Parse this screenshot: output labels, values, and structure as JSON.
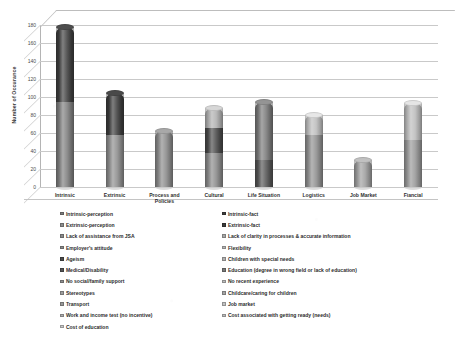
{
  "chart_data": {
    "type": "bar",
    "subtype": "stacked-column-3d",
    "title": "",
    "xlabel": "",
    "ylabel": "Number of Occurance",
    "ylim": [
      0,
      180
    ],
    "ytick_step": 20,
    "yticks": [
      "0",
      "20",
      "40",
      "60",
      "80",
      "100",
      "120",
      "140",
      "160",
      "180"
    ],
    "grid": true,
    "legend_position": "bottom",
    "categories": [
      "Intrinsic",
      "Extrinsic",
      "Process and Policies",
      "Cultural",
      "Life Situation",
      "Logistics",
      "Job Market",
      "Fiancial"
    ],
    "series": [
      {
        "name": "Intrinsic-perception",
        "color": "#7e7e7e",
        "values": [
          94,
          0,
          0,
          0,
          0,
          0,
          0,
          0
        ]
      },
      {
        "name": "Intrinsic-fact",
        "color": "#404040",
        "values": [
          84,
          0,
          0,
          0,
          0,
          0,
          0,
          0
        ]
      },
      {
        "name": "Extrinsic-perception",
        "color": "#8d8d8d",
        "values": [
          0,
          58,
          0,
          0,
          0,
          0,
          0,
          0
        ]
      },
      {
        "name": "Extrinsic-fact",
        "color": "#3c3c3c",
        "values": [
          0,
          47,
          0,
          0,
          0,
          0,
          0,
          0
        ]
      },
      {
        "name": "Lack of assistance from JSA",
        "color": "#8a8a8a",
        "values": [
          0,
          0,
          62,
          0,
          0,
          0,
          0,
          0
        ]
      },
      {
        "name": "Lack of clarity in processes & accurate information",
        "color": "#a8a8a8",
        "values": [
          0,
          0,
          0,
          0,
          0,
          0,
          0,
          0
        ]
      },
      {
        "name": "Employer's attitude",
        "color": "#8a8a8a",
        "values": [
          0,
          0,
          0,
          38,
          0,
          0,
          0,
          0
        ]
      },
      {
        "name": "Flexibility",
        "color": "#b5b5b5",
        "values": [
          0,
          0,
          0,
          0,
          0,
          0,
          0,
          0
        ]
      },
      {
        "name": "Ageism",
        "color": "#4a4a4a",
        "values": [
          0,
          0,
          0,
          28,
          0,
          0,
          0,
          0
        ]
      },
      {
        "name": "Children with special needs",
        "color": "#b0b0b0",
        "values": [
          0,
          0,
          0,
          22,
          0,
          0,
          0,
          0
        ]
      },
      {
        "name": "Medical/Disability",
        "color": "#555555",
        "values": [
          0,
          0,
          0,
          0,
          30,
          0,
          0,
          0
        ]
      },
      {
        "name": "Education (degree in wrong field or lack of education)",
        "color": "#757575",
        "values": [
          0,
          0,
          0,
          0,
          65,
          0,
          0,
          0
        ]
      },
      {
        "name": "No social/family support",
        "color": "#8f8f8f",
        "values": [
          0,
          0,
          0,
          0,
          0,
          58,
          0,
          0
        ]
      },
      {
        "name": "No recent experience",
        "color": "#bdbdbd",
        "values": [
          0,
          0,
          0,
          0,
          0,
          22,
          0,
          0
        ]
      },
      {
        "name": "Stereotypes",
        "color": "#9e9e9e",
        "values": [
          0,
          0,
          0,
          0,
          0,
          0,
          30,
          0
        ]
      },
      {
        "name": "Childcare/caring for children",
        "color": "#a5a5a5",
        "values": [
          0,
          0,
          0,
          0,
          0,
          0,
          0,
          0
        ]
      },
      {
        "name": "Transport",
        "color": "#989898",
        "values": [
          0,
          0,
          0,
          0,
          0,
          0,
          0,
          52
        ]
      },
      {
        "name": "Job market",
        "color": "#c2c2c2",
        "values": [
          0,
          0,
          0,
          0,
          0,
          0,
          0,
          0
        ]
      },
      {
        "name": "Work and income test (no incentive)",
        "color": "#adadad",
        "values": [
          0,
          0,
          0,
          0,
          0,
          0,
          0,
          0
        ]
      },
      {
        "name": "Cost associated with getting ready (needs)",
        "color": "#bcbcbc",
        "values": [
          0,
          0,
          0,
          0,
          0,
          0,
          0,
          41
        ]
      },
      {
        "name": "Cost of education",
        "color": "#c9c9c9",
        "values": [
          0,
          0,
          0,
          0,
          0,
          0,
          0,
          0
        ]
      }
    ],
    "bars": [
      {
        "category": "Intrinsic",
        "total": 178,
        "segments": [
          {
            "label": "Intrinsic-perception",
            "value": 94,
            "color": "#7e7e7e"
          },
          {
            "label": "Intrinsic-fact",
            "value": 84,
            "color": "#3f3f3f"
          }
        ]
      },
      {
        "category": "Extrinsic",
        "total": 105,
        "segments": [
          {
            "label": "Extrinsic-perception",
            "value": 58,
            "color": "#8d8d8d"
          },
          {
            "label": "Extrinsic-fact",
            "value": 47,
            "color": "#3c3c3c"
          }
        ]
      },
      {
        "category": "Process and Policies",
        "total": 62,
        "segments": [
          {
            "label": "Lack of assistance from JSA",
            "value": 62,
            "color": "#8a8a8a"
          }
        ]
      },
      {
        "category": "Cultural",
        "total": 88,
        "segments": [
          {
            "label": "Employer's attitude",
            "value": 38,
            "color": "#8a8a8a"
          },
          {
            "label": "Ageism",
            "value": 28,
            "color": "#4a4a4a"
          },
          {
            "label": "Children with special needs",
            "value": 22,
            "color": "#b0b0b0"
          }
        ]
      },
      {
        "category": "Life Situation",
        "total": 95,
        "segments": [
          {
            "label": "Medical/Disability",
            "value": 30,
            "color": "#555555"
          },
          {
            "label": "Education (degree in wrong field or lack of education)",
            "value": 65,
            "color": "#797979"
          }
        ]
      },
      {
        "category": "Logistics",
        "total": 80,
        "segments": [
          {
            "label": "No social/family support",
            "value": 58,
            "color": "#8f8f8f"
          },
          {
            "label": "No recent experience",
            "value": 22,
            "color": "#bdbdbd"
          }
        ]
      },
      {
        "category": "Job Market",
        "total": 30,
        "segments": [
          {
            "label": "Stereotypes",
            "value": 30,
            "color": "#9e9e9e"
          }
        ]
      },
      {
        "category": "Fiancial",
        "total": 93,
        "segments": [
          {
            "label": "Transport",
            "value": 52,
            "color": "#989898"
          },
          {
            "label": "Cost associated with getting ready (needs)",
            "value": 41,
            "color": "#bcbcbc"
          }
        ]
      }
    ],
    "legend": {
      "left_column": [
        {
          "label": "Intrinsic-perception",
          "color": "#7e7e7e"
        },
        {
          "label": "Extrinsic-perception",
          "color": "#8d8d8d"
        },
        {
          "label": "Lack of assistance from JSA",
          "color": "#8a8a8a"
        },
        {
          "label": "Employer's attitude",
          "color": "#8a8a8a"
        },
        {
          "label": "Ageism",
          "color": "#4a4a4a"
        },
        {
          "label": "Medical/Disability",
          "color": "#555555"
        },
        {
          "label": "No social/family support",
          "color": "#8f8f8f"
        },
        {
          "label": "Stereotypes",
          "color": "#9e9e9e"
        },
        {
          "label": "Transport",
          "color": "#989898"
        },
        {
          "label": "Work and income test (no incentive)",
          "color": "#adadad"
        },
        {
          "label": "Cost of education",
          "color": "#c9c9c9"
        }
      ],
      "right_column": [
        {
          "label": "Intrinsic-fact",
          "color": "#3f3f3f"
        },
        {
          "label": "Extrinsic-fact",
          "color": "#3c3c3c"
        },
        {
          "label": "Lack of clarity in processes & accurate information",
          "color": "#a8a8a8"
        },
        {
          "label": "Flexibility",
          "color": "#b5b5b5"
        },
        {
          "label": "Children with special needs",
          "color": "#b0b0b0"
        },
        {
          "label": "Education (degree in wrong field or lack of education)",
          "color": "#797979"
        },
        {
          "label": "No recent experience",
          "color": "#bdbdbd"
        },
        {
          "label": "Childcare/caring for children",
          "color": "#a5a5a5"
        },
        {
          "label": "Job market",
          "color": "#c2c2c2"
        },
        {
          "label": "Cost associated with getting ready (needs)",
          "color": "#bcbcbc"
        }
      ]
    }
  }
}
